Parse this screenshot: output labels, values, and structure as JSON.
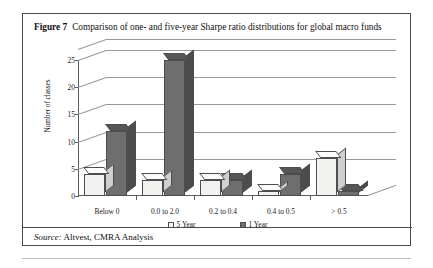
{
  "figure": {
    "number_label": "Figure 7",
    "caption": "Comparison of one- and five-year Sharpe ratio distributions for global macro funds",
    "source_label": "Source:",
    "source_text": " Altvest, CMRA Analysis"
  },
  "colors": {
    "five_year_bar": "#f2f2f0",
    "one_year_bar": "#6e6e6e",
    "gridline": "#9a9a9a",
    "axis": "#5a5a5a",
    "border": "#4a4a4a"
  },
  "chart_data": {
    "type": "bar",
    "title": "Comparison of one- and five-year Sharpe ratio distributions for global macro funds",
    "xlabel": "",
    "ylabel": "Number of classes",
    "ylim": [
      0,
      25
    ],
    "yticks": [
      0,
      5,
      10,
      15,
      20,
      25
    ],
    "ytick_labels": [
      "0",
      "5",
      "10",
      "15",
      "20",
      "25"
    ],
    "grid": true,
    "legend_position": "bottom",
    "categories": [
      "Below 0",
      "0.0 to 2.0",
      "0.2 to 0.4",
      "0.4 to 0.5",
      "> 0.5"
    ],
    "series": [
      {
        "name": "5 Year",
        "values": [
          4,
          3,
          3,
          1,
          7
        ]
      },
      {
        "name": "1 Year",
        "values": [
          12,
          25,
          3,
          4,
          1
        ]
      }
    ]
  }
}
